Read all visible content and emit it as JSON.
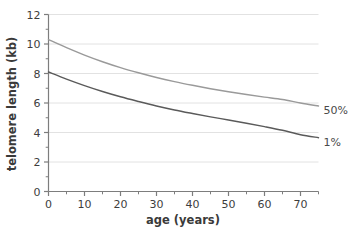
{
  "chart_data": {
    "type": "line",
    "title": "",
    "xlabel": "age (years)",
    "ylabel": "telomere length (kb)",
    "xlim": [
      0,
      75
    ],
    "ylim": [
      0,
      12
    ],
    "grid": true,
    "grid_axis": "y",
    "legend_position": "right-of-axes-inline",
    "x_ticks_major": [
      0,
      10,
      20,
      30,
      40,
      50,
      60,
      70
    ],
    "x_tick_labels": [
      "0",
      "10",
      "20",
      "30",
      "40",
      "50",
      "60",
      "70"
    ],
    "x_ticks_minor": [
      5,
      15,
      25,
      35,
      45,
      55,
      65,
      75
    ],
    "y_ticks_major": [
      0,
      2,
      4,
      6,
      8,
      10,
      12
    ],
    "y_tick_labels": [
      "0",
      "2",
      "4",
      "6",
      "8",
      "10",
      "12"
    ],
    "y_ticks_minor": [
      1,
      3,
      5,
      7,
      9,
      11
    ],
    "series": [
      {
        "name": "50%",
        "label": "50%",
        "color": "#9a9a9a",
        "x": [
          0,
          5,
          10,
          15,
          20,
          25,
          30,
          35,
          40,
          45,
          50,
          55,
          60,
          65,
          70,
          75
        ],
        "values": [
          10.3,
          9.75,
          9.25,
          8.8,
          8.4,
          8.05,
          7.73,
          7.45,
          7.2,
          6.97,
          6.76,
          6.57,
          6.4,
          6.24,
          6.0,
          5.8
        ]
      },
      {
        "name": "1%",
        "label": "1%",
        "color": "#5a5a5a",
        "x": [
          0,
          5,
          10,
          15,
          20,
          25,
          30,
          35,
          40,
          45,
          50,
          55,
          60,
          65,
          70,
          75
        ],
        "values": [
          8.1,
          7.62,
          7.18,
          6.78,
          6.42,
          6.1,
          5.8,
          5.53,
          5.29,
          5.06,
          4.85,
          4.63,
          4.4,
          4.15,
          3.85,
          3.65
        ]
      }
    ],
    "colors": {
      "axis": "#7d7d7d",
      "grid": "#e2e2e2",
      "tick_label": "#3d3d3d",
      "axis_title": "#3a3a3a",
      "background": "#ffffff"
    }
  }
}
